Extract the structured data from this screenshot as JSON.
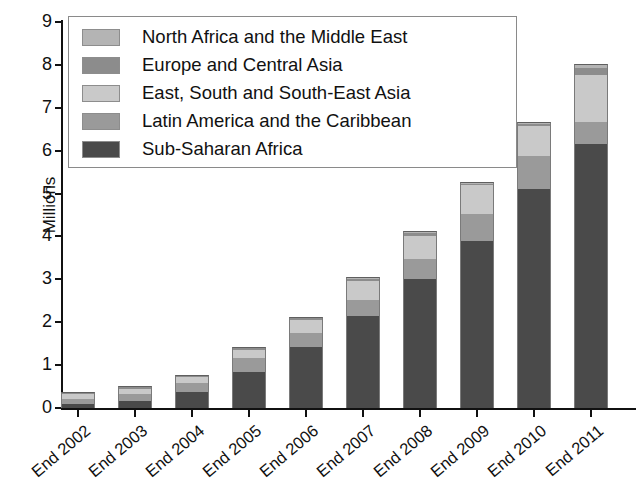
{
  "chart_data": {
    "type": "bar",
    "subtype": "stacked-bar",
    "title": "",
    "xlabel": "",
    "ylabel": "Millions",
    "ylim": [
      0,
      9
    ],
    "ytick_values": [
      0,
      1,
      2,
      3,
      4,
      5,
      6,
      7,
      8,
      9
    ],
    "ytick_labels": [
      "0",
      "1",
      "2",
      "3",
      "4",
      "5",
      "6",
      "7",
      "8",
      "9"
    ],
    "grid": false,
    "legend_position": "upper-left-inside",
    "categories": [
      "End 2002",
      "End 2003",
      "End 2004",
      "End 2005",
      "End 2006",
      "End 2007",
      "End 2008",
      "End 2009",
      "End 2010",
      "End 2011"
    ],
    "series": [
      {
        "name": "Sub-Saharan Africa",
        "color": "#4a4a4a",
        "values": [
          0.1,
          0.17,
          0.38,
          0.85,
          1.42,
          2.15,
          3.0,
          3.9,
          5.1,
          6.15
        ]
      },
      {
        "name": "Latin America and the Caribbean",
        "color": "#9a9a9a",
        "values": [
          0.12,
          0.16,
          0.2,
          0.32,
          0.33,
          0.37,
          0.48,
          0.63,
          0.78,
          0.52
        ]
      },
      {
        "name": "East, South and South-East Asia",
        "color": "#c9c9c9",
        "values": [
          0.1,
          0.12,
          0.14,
          0.18,
          0.3,
          0.45,
          0.52,
          0.66,
          0.7,
          1.1
        ]
      },
      {
        "name": "Europe and Central Asia",
        "color": "#8c8c8c",
        "values": [
          0.03,
          0.03,
          0.03,
          0.04,
          0.04,
          0.05,
          0.07,
          0.04,
          0.05,
          0.15
        ]
      },
      {
        "name": "North Africa and the Middle East",
        "color": "#b4b4b4",
        "values": [
          0.03,
          0.02,
          0.02,
          0.03,
          0.03,
          0.04,
          0.05,
          0.05,
          0.05,
          0.1
        ]
      }
    ],
    "totals": [
      0.38,
      0.5,
      0.77,
      1.42,
      2.12,
      3.06,
      4.12,
      5.28,
      6.68,
      8.02
    ],
    "legend_entries": [
      "North Africa and the Middle East",
      "Europe and Central Asia",
      "East, South and South-East Asia",
      "Latin America and the Caribbean",
      "Sub-Saharan Africa"
    ]
  },
  "legend": {
    "items": [
      {
        "label": "North Africa and the Middle East",
        "color": "#b4b4b4"
      },
      {
        "label": "Europe and Central Asia",
        "color": "#8c8c8c"
      },
      {
        "label": "East, South and South-East Asia",
        "color": "#c9c9c9"
      },
      {
        "label": "Latin America and the Caribbean",
        "color": "#9a9a9a"
      },
      {
        "label": "Sub-Saharan Africa",
        "color": "#4a4a4a"
      }
    ]
  },
  "axes": {
    "y_title": "Millions",
    "y_ticks": [
      "9",
      "8",
      "7",
      "6",
      "5",
      "4",
      "3",
      "2",
      "1",
      "0"
    ],
    "x_ticks": [
      "End 2002",
      "End 2003",
      "End 2004",
      "End 2005",
      "End 2006",
      "End 2007",
      "End 2008",
      "End 2009",
      "End 2010",
      "End 2011"
    ]
  },
  "colors": {
    "axis": "#111111",
    "background": "#ffffff",
    "legend_border": "#8a8a8a"
  }
}
